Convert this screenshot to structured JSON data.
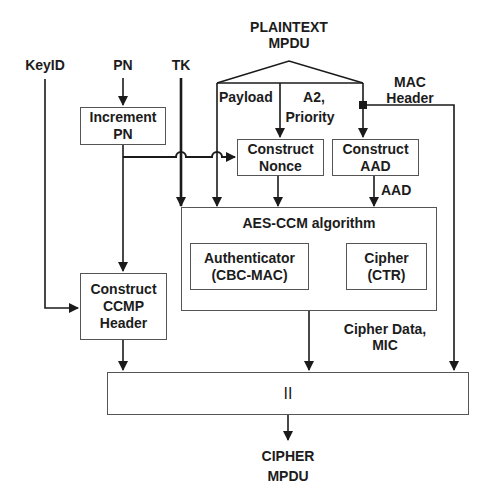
{
  "diagram": {
    "inputs": {
      "plaintext": [
        "PLAINTEXT",
        "MPDU"
      ],
      "key_id": "KeyID",
      "pn": "PN",
      "tk": "TK",
      "mac_header": [
        "MAC",
        "Header"
      ]
    },
    "edge_labels": {
      "payload": "Payload",
      "a2_priority": [
        "A2,",
        "Priority"
      ],
      "aad": "AAD",
      "cipher_data_mic": [
        "Cipher Data,",
        "MIC"
      ]
    },
    "blocks": {
      "increment_pn": [
        "Increment",
        "PN"
      ],
      "construct_nonce": [
        "Construct",
        "Nonce"
      ],
      "construct_aad": [
        "Construct",
        "AAD"
      ],
      "aes_ccm": "AES-CCM algorithm",
      "authenticator": [
        "Authenticator",
        "(CBC-MAC)"
      ],
      "cipher": [
        "Cipher",
        "(CTR)"
      ],
      "construct_ccmp_header": [
        "Construct",
        "CCMP",
        "Header"
      ],
      "concatenate": "II"
    },
    "output": [
      "CIPHER",
      "MPDU"
    ]
  }
}
